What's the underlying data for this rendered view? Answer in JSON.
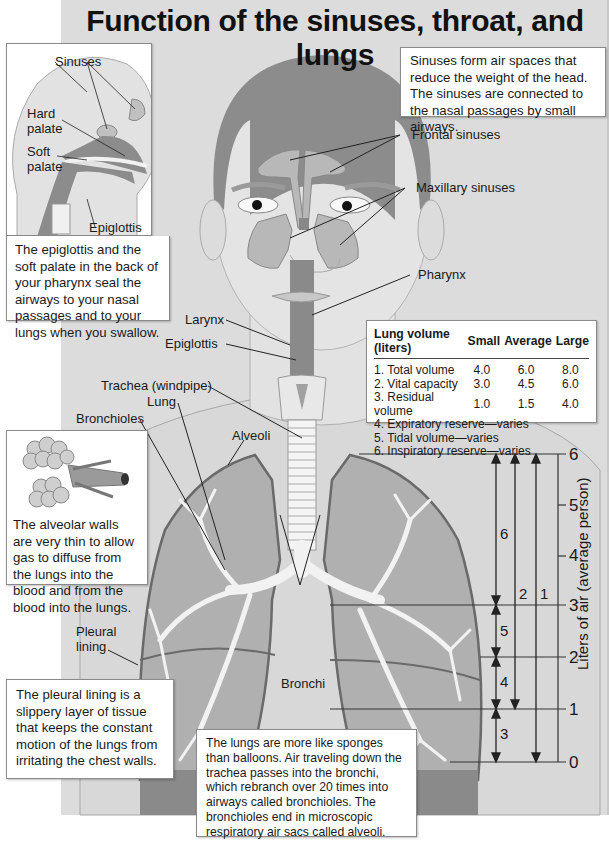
{
  "title": "Function of the sinuses, throat, and lungs",
  "head_inset": {
    "labels": {
      "sinuses": "Sinuses",
      "hard_palate_1": "Hard",
      "hard_palate_2": "palate",
      "soft_palate_1": "Soft",
      "soft_palate_2": "palate",
      "epiglottis": "Epiglottis"
    },
    "text": "The epiglottis and the soft palate in the back of your pharynx seal the airways to your nasal passages and to your lungs when you swallow."
  },
  "sinus_note": "Sinuses form air spaces that reduce the weight of the head. The sinuses are connected to the nasal passages by small airways.",
  "labels": {
    "frontal_sinuses": "Frontal sinuses",
    "maxillary_sinuses": "Maxillary sinuses",
    "pharynx": "Pharynx",
    "larynx": "Larynx",
    "epiglottis": "Epiglottis",
    "trachea": "Trachea (windpipe)",
    "lung": "Lung",
    "bronchioles": "Bronchioles",
    "alveoli": "Alveoli",
    "pleural_lining_1": "Pleural",
    "pleural_lining_2": "lining",
    "bronchi": "Bronchi"
  },
  "alveolar_note": "The alveolar walls are very thin to allow gas to diffuse from the lungs into the blood and from the blood into the lungs.",
  "pleural_note": "The pleural lining is a slippery layer of tissue that keeps the constant motion of the lungs from irritating the chest walls.",
  "lungs_note": "The lungs are more like sponges than balloons. Air traveling down the trachea passes into the bronchi, which rebranch over 20 times into airways called bronchioles. The bronchioles end in microscopic respiratory air sacs called alveoli.",
  "lung_volume_table": {
    "headers": [
      "Lung volume (liters)",
      "Small",
      "Average",
      "Large"
    ],
    "rows": [
      {
        "label": "1. Total volume",
        "small": "4.0",
        "average": "6.0",
        "large": "8.0"
      },
      {
        "label": "2. Vital capacity",
        "small": "3.0",
        "average": "4.5",
        "large": "6.0"
      },
      {
        "label": "3. Residual volume",
        "small": "1.0",
        "average": "1.5",
        "large": "4.0"
      }
    ],
    "varies_rows": [
      "4. Expiratory reserve—varies",
      "5. Tidal volume—varies",
      "6. Inspiratory reserve—varies"
    ]
  },
  "volume_scale": {
    "axis_label": "Liters of air (average person)",
    "ticks": [
      "0",
      "1",
      "2",
      "3",
      "4",
      "5",
      "6"
    ],
    "arrows": [
      {
        "id": "1",
        "from": 0,
        "to": 6
      },
      {
        "id": "2",
        "from": 1,
        "to": 6
      },
      {
        "id": "3",
        "from": 0,
        "to": 1
      },
      {
        "id": "4",
        "from": 1,
        "to": 2
      },
      {
        "id": "5",
        "from": 2,
        "to": 3
      },
      {
        "id": "6",
        "from": 3,
        "to": 6
      }
    ]
  },
  "colors": {
    "panel_bg": "#dcdcdc",
    "skin": "#e4e4e4",
    "hair": "#8c8c8c",
    "sinus_fill": "#b8b8b8",
    "lung_fill": "#b0b0b0",
    "lung_outline": "#6a6a6a",
    "airway_fill": "#f2f2f2",
    "pharynx_fill": "#8a8a8a"
  }
}
